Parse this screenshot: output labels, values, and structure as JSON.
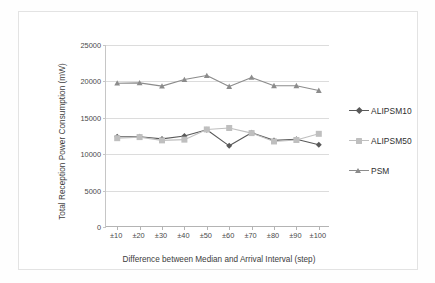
{
  "chart_data": {
    "type": "line",
    "title": "",
    "xlabel": "Difference between Median and Arrival Interval (step)",
    "ylabel": "Total Reception Power Consumption (mW)",
    "categories": [
      "±10",
      "±20",
      "±30",
      "±40",
      "±50",
      "±60",
      "±70",
      "±80",
      "±90",
      "±100"
    ],
    "ylim": [
      0,
      25000
    ],
    "yticks": [
      0,
      5000,
      10000,
      15000,
      20000,
      25000
    ],
    "ytick_labels": [
      "0",
      "5000",
      "10000",
      "15000",
      "20000",
      "25000"
    ],
    "grid": true,
    "legend_position": "right",
    "series": [
      {
        "name": "ALIPSM10",
        "marker": "diamond",
        "color": "#595959",
        "values": [
          12400,
          12400,
          12100,
          12500,
          13350,
          11150,
          12950,
          11900,
          12050,
          11300
        ]
      },
      {
        "name": "ALIPSM50",
        "marker": "square",
        "color": "#bfbfbf",
        "values": [
          12200,
          12350,
          11900,
          12000,
          13400,
          13600,
          12900,
          11750,
          11950,
          12800
        ]
      },
      {
        "name": "PSM",
        "marker": "triangle",
        "color": "#8c8c8c",
        "values": [
          19750,
          19800,
          19350,
          20250,
          20800,
          19300,
          20550,
          19400,
          19400,
          18750
        ]
      }
    ]
  },
  "axes": {
    "y_title": "Total Reception Power Consumption (mW)",
    "x_title": "Difference between Median and Arrival Interval (step)"
  },
  "legend": {
    "items": [
      {
        "label": "ALIPSM10"
      },
      {
        "label": "ALIPSM50"
      },
      {
        "label": "PSM"
      }
    ]
  },
  "colors": {
    "series_1": "#595959",
    "series_2": "#bfbfbf",
    "series_3": "#8c8c8c",
    "gridline": "#dcdcdc",
    "axis": "#b4b4b4",
    "frame": "#e3e3e3"
  }
}
